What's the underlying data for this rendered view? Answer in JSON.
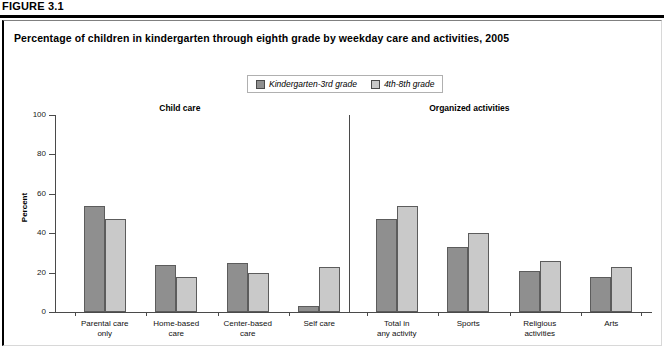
{
  "figure": {
    "label": "FIGURE 3.1",
    "title": "Percentage of children in kindergarten through eighth grade by weekday care and activities, 2005"
  },
  "legend": {
    "items": [
      {
        "label": "Kindergarten-3rd grade",
        "color": "#8f8f8f"
      },
      {
        "label": "4th-8th grade",
        "color": "#c9c9c9"
      }
    ]
  },
  "colors": {
    "series_1": "#8f8f8f",
    "series_2": "#c9c9c9",
    "bar_outline": "#5c5c5c",
    "axis": "#4a4a4a"
  },
  "sections": [
    {
      "name": "Child care"
    },
    {
      "name": "Organized activities"
    }
  ],
  "chart_data": {
    "type": "bar",
    "title": "Percentage of children in kindergarten through eighth grade by weekday care and activities, 2005",
    "xlabel": "",
    "ylabel": "Percent",
    "ylim": [
      0,
      100
    ],
    "yticks": [
      0,
      20,
      40,
      60,
      80,
      100
    ],
    "grid": false,
    "legend_position": "top-center",
    "groups": [
      "Child care",
      "Organized activities"
    ],
    "categories": [
      "Parental care only",
      "Home-based care",
      "Center-based care",
      "Self care",
      "Total in any activity",
      "Sports",
      "Religious activities",
      "Arts"
    ],
    "category_group": [
      "Child care",
      "Child care",
      "Child care",
      "Child care",
      "Organized activities",
      "Organized activities",
      "Organized activities",
      "Organized activities"
    ],
    "series": [
      {
        "name": "Kindergarten-3rd grade",
        "values": [
          54,
          24,
          25,
          3,
          47,
          33,
          21,
          18
        ]
      },
      {
        "name": "4th-8th grade",
        "values": [
          47,
          18,
          20,
          23,
          54,
          40,
          26,
          23
        ]
      }
    ]
  },
  "axis": {
    "ytick_labels": [
      "0",
      "20",
      "40",
      "60",
      "80",
      "100"
    ],
    "y_title": "Percent"
  },
  "xlabels": [
    "Parental care\nonly",
    "Home-based\ncare",
    "Center-based\ncare",
    "Self care",
    "Total in\nany activity",
    "Sports",
    "Religious\nactivities",
    "Arts"
  ]
}
